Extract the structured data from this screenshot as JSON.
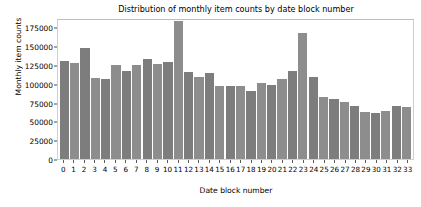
{
  "chart_data": {
    "type": "bar",
    "title": "Distribution of monthly item counts by date block number",
    "xlabel": "Date block number",
    "ylabel": "Monthly item counts",
    "categories": [
      "0",
      "1",
      "2",
      "3",
      "4",
      "5",
      "6",
      "7",
      "8",
      "9",
      "10",
      "11",
      "12",
      "13",
      "14",
      "15",
      "16",
      "17",
      "18",
      "19",
      "20",
      "21",
      "22",
      "23",
      "24",
      "25",
      "26",
      "27",
      "28",
      "29",
      "30",
      "31",
      "32",
      "33"
    ],
    "values": [
      131000,
      127500,
      147500,
      107500,
      106500,
      125000,
      117000,
      125000,
      132500,
      127000,
      129500,
      183000,
      116000,
      109000,
      114500,
      96500,
      97500,
      96500,
      90500,
      101500,
      98500,
      106000,
      117000,
      167000,
      109500,
      82500,
      80000,
      76000,
      70000,
      62000,
      61000,
      63500,
      71000,
      69500
    ],
    "ytick_labels": [
      "0",
      "25000",
      "50000",
      "75000",
      "100000",
      "125000",
      "150000",
      "175000"
    ],
    "ytick_values": [
      0,
      25000,
      50000,
      75000,
      100000,
      125000,
      150000,
      175000
    ],
    "ylim": [
      0,
      187500
    ],
    "grid": false,
    "legend": null,
    "bar_color": "#7d7d7d",
    "bar_color_alt": "#8d8d8d"
  }
}
